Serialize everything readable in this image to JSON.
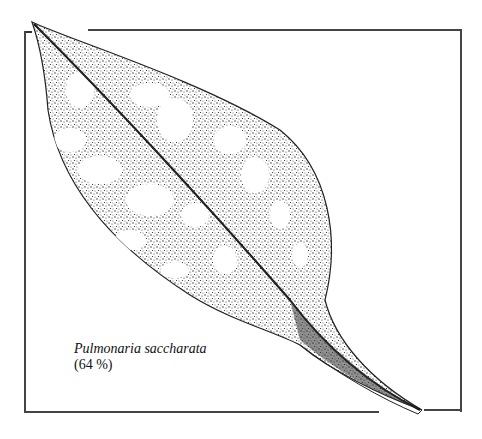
{
  "figure": {
    "species": "Pulmonaria saccharata",
    "percentage": "(64 %)",
    "stroke_color": "#222222",
    "background": "#ffffff"
  }
}
